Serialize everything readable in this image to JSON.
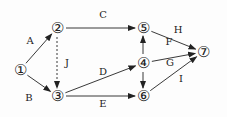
{
  "diagram": {
    "type": "network",
    "nodes": [
      {
        "id": "1",
        "label": "①",
        "x": 20,
        "y": 70
      },
      {
        "id": "2",
        "label": "②",
        "x": 57,
        "y": 28
      },
      {
        "id": "3",
        "label": "③",
        "x": 57,
        "y": 96
      },
      {
        "id": "4",
        "label": "④",
        "x": 143,
        "y": 63
      },
      {
        "id": "5",
        "label": "⑤",
        "x": 143,
        "y": 28
      },
      {
        "id": "6",
        "label": "⑥",
        "x": 143,
        "y": 96
      },
      {
        "id": "7",
        "label": "⑦",
        "x": 203,
        "y": 52
      }
    ],
    "edges": [
      {
        "label": "A",
        "from": "1",
        "to": "2",
        "dashed": false
      },
      {
        "label": "B",
        "from": "1",
        "to": "3",
        "dashed": false
      },
      {
        "label": "C",
        "from": "2",
        "to": "5",
        "dashed": false
      },
      {
        "label": "J",
        "from": "2",
        "to": "3",
        "dashed": true
      },
      {
        "label": "D",
        "from": "3",
        "to": "4",
        "dashed": false
      },
      {
        "label": "E",
        "from": "3",
        "to": "6",
        "dashed": false
      },
      {
        "label": "F",
        "from": "4",
        "to": "5",
        "dashed": false
      },
      {
        "label": "",
        "from": "4",
        "to": "6",
        "dashed": false
      },
      {
        "label": "H",
        "from": "5",
        "to": "7",
        "dashed": false
      },
      {
        "label": "G",
        "from": "4",
        "to": "7",
        "dashed": false
      },
      {
        "label": "I",
        "from": "6",
        "to": "7",
        "dashed": false
      }
    ],
    "edge_labels": [
      {
        "text": "A",
        "x": 30,
        "y": 44
      },
      {
        "text": "B",
        "x": 29,
        "y": 101
      },
      {
        "text": "C",
        "x": 103,
        "y": 18
      },
      {
        "text": "J",
        "x": 67,
        "y": 66
      },
      {
        "text": "D",
        "x": 103,
        "y": 75
      },
      {
        "text": "E",
        "x": 103,
        "y": 107
      },
      {
        "text": "H",
        "x": 178,
        "y": 33
      },
      {
        "text": "F",
        "x": 169,
        "y": 45
      },
      {
        "text": "G",
        "x": 170,
        "y": 66
      },
      {
        "text": "I",
        "x": 181,
        "y": 82
      }
    ]
  }
}
